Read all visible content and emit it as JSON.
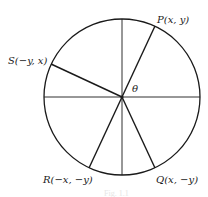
{
  "diagram": {
    "type": "unit-circle-symmetry",
    "center": {
      "x": 122,
      "y": 97
    },
    "radius": 78,
    "stroke_color": "#1a1a1a",
    "axes": [
      "horizontal-diameter",
      "vertical-diameter"
    ],
    "angle_label": "θ",
    "points": [
      {
        "id": "P",
        "label": "P(x, y)",
        "x": 155,
        "y": 26
      },
      {
        "id": "S",
        "label": "S(−y, x)",
        "x": 51,
        "y": 64
      },
      {
        "id": "R",
        "label": "R(−x, −y)",
        "x": 89,
        "y": 168
      },
      {
        "id": "Q",
        "label": "Q(x, −y)",
        "x": 155,
        "y": 168
      }
    ],
    "caption": "Fig. 1.1"
  }
}
